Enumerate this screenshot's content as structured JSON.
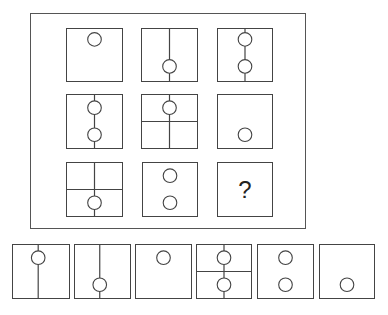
{
  "puzzle": {
    "question_mark": "?",
    "stroke_color": "#444444",
    "grid": [
      {
        "id": "r1c1",
        "x": 66,
        "y": 28,
        "w": 57,
        "h": 54,
        "vline": false,
        "hline": false,
        "circles": [
          [
            0.5,
            0.2
          ]
        ]
      },
      {
        "id": "r1c2",
        "x": 141,
        "y": 28,
        "w": 57,
        "h": 54,
        "vline": true,
        "hline": false,
        "circles": [
          [
            0.5,
            0.72
          ]
        ]
      },
      {
        "id": "r1c3",
        "x": 217,
        "y": 28,
        "w": 56,
        "h": 54,
        "vline": true,
        "hline": false,
        "circles": [
          [
            0.5,
            0.2
          ],
          [
            0.5,
            0.72
          ]
        ]
      },
      {
        "id": "r2c1",
        "x": 66,
        "y": 94,
        "w": 57,
        "h": 55,
        "vline": true,
        "hline": false,
        "circles": [
          [
            0.5,
            0.24
          ],
          [
            0.5,
            0.75
          ]
        ]
      },
      {
        "id": "r2c2",
        "x": 141,
        "y": 94,
        "w": 57,
        "h": 55,
        "vline": true,
        "hline": true,
        "circles": [
          [
            0.5,
            0.24
          ]
        ]
      },
      {
        "id": "r2c3",
        "x": 217,
        "y": 94,
        "w": 56,
        "h": 55,
        "vline": false,
        "hline": false,
        "circles": [
          [
            0.5,
            0.75
          ]
        ]
      },
      {
        "id": "r3c1",
        "x": 66,
        "y": 162,
        "w": 57,
        "h": 55,
        "vline": true,
        "hline": true,
        "circles": [
          [
            0.5,
            0.75
          ]
        ]
      },
      {
        "id": "r3c2",
        "x": 142,
        "y": 162,
        "w": 56,
        "h": 55,
        "vline": false,
        "hline": false,
        "circles": [
          [
            0.5,
            0.24
          ],
          [
            0.5,
            0.75
          ]
        ]
      },
      {
        "id": "r3c3",
        "x": 217,
        "y": 162,
        "w": 56,
        "h": 55,
        "question": true
      }
    ],
    "options": [
      {
        "id": "option-1",
        "x": 12,
        "y": 244,
        "w": 58,
        "h": 55,
        "vline": true,
        "hline": false,
        "circles": [
          [
            0.45,
            0.24
          ]
        ],
        "vx": 0.45
      },
      {
        "id": "option-2",
        "x": 74,
        "y": 244,
        "w": 57,
        "h": 55,
        "vline": true,
        "hline": false,
        "circles": [
          [
            0.45,
            0.75
          ]
        ],
        "vx": 0.45
      },
      {
        "id": "option-3",
        "x": 135,
        "y": 244,
        "w": 57,
        "h": 55,
        "vline": false,
        "hline": false,
        "circles": [
          [
            0.5,
            0.24
          ]
        ]
      },
      {
        "id": "option-4",
        "x": 196,
        "y": 244,
        "w": 56,
        "h": 55,
        "vline": true,
        "hline": true,
        "circles": [
          [
            0.5,
            0.24
          ],
          [
            0.5,
            0.75
          ]
        ]
      },
      {
        "id": "option-5",
        "x": 257,
        "y": 244,
        "w": 57,
        "h": 55,
        "vline": false,
        "hline": false,
        "circles": [
          [
            0.5,
            0.24
          ],
          [
            0.5,
            0.75
          ]
        ]
      },
      {
        "id": "option-6",
        "x": 319,
        "y": 244,
        "w": 56,
        "h": 55,
        "vline": false,
        "hline": false,
        "circles": [
          [
            0.5,
            0.75
          ]
        ]
      }
    ]
  }
}
